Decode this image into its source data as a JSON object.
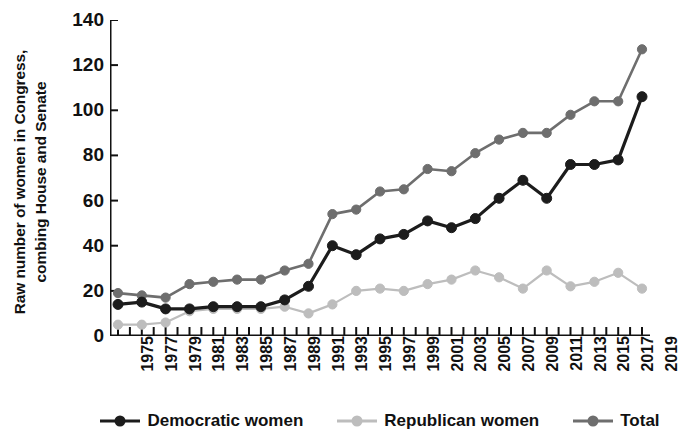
{
  "chart_data": {
    "type": "line",
    "title": "",
    "xlabel": "",
    "ylabel": "Raw number of women in Congress,\ncombing House and Senate",
    "ylim": [
      0,
      140
    ],
    "yticks": [
      0,
      20,
      40,
      60,
      80,
      100,
      120,
      140
    ],
    "grid": false,
    "legend_position": "bottom",
    "x": [
      1975,
      1977,
      1979,
      1981,
      1983,
      1985,
      1987,
      1989,
      1991,
      1993,
      1995,
      1997,
      1999,
      2001,
      2003,
      2005,
      2007,
      2009,
      2011,
      2013,
      2015,
      2017,
      2019
    ],
    "categories": [
      "1975",
      "1977",
      "1979",
      "1981",
      "1983",
      "1985",
      "1987",
      "1989",
      "1991",
      "1993",
      "1995",
      "1997",
      "1999",
      "2001",
      "2003",
      "2005",
      "2007",
      "2009",
      "2011",
      "2013",
      "2015",
      "2017",
      "2019"
    ],
    "series": [
      {
        "name": "Democratic women",
        "color": "#1c1c1c",
        "values": [
          14,
          15,
          12,
          12,
          13,
          13,
          13,
          16,
          22,
          40,
          36,
          43,
          45,
          51,
          48,
          52,
          61,
          69,
          61,
          76,
          76,
          78,
          106
        ]
      },
      {
        "name": "Republican women",
        "color": "#bdbdbd",
        "values": [
          5,
          5,
          6,
          11,
          12,
          12,
          12,
          13,
          10,
          14,
          20,
          21,
          20,
          23,
          25,
          29,
          26,
          21,
          29,
          22,
          24,
          28,
          21
        ]
      },
      {
        "name": "Total",
        "color": "#6e6e6e",
        "values": [
          19,
          18,
          17,
          23,
          24,
          25,
          25,
          29,
          32,
          54,
          56,
          64,
          65,
          74,
          73,
          81,
          87,
          90,
          90,
          98,
          104,
          104,
          127
        ]
      }
    ]
  },
  "legend": {
    "items": [
      {
        "label": "Democratic women",
        "color": "#1c1c1c"
      },
      {
        "label": "Republican women",
        "color": "#bdbdbd"
      },
      {
        "label": "Total",
        "color": "#6e6e6e"
      }
    ]
  },
  "axis": {
    "y_title": "Raw number of women in Congress, combing House and Senate"
  }
}
